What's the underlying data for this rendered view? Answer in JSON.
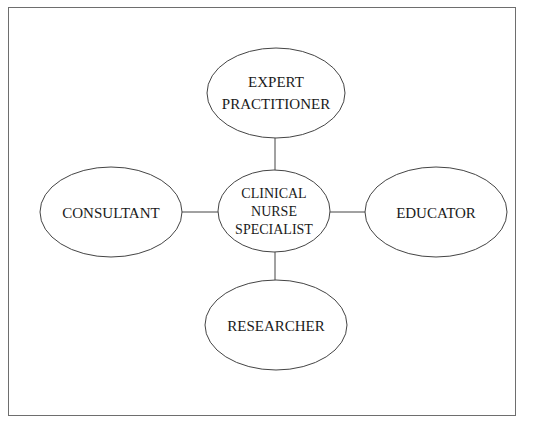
{
  "diagram": {
    "type": "hub-and-spoke",
    "center": {
      "id": "center",
      "lines": [
        "CLINICAL",
        "NURSE",
        "SPECIALIST"
      ]
    },
    "nodes": [
      {
        "id": "top",
        "position": "top",
        "lines": [
          "EXPERT",
          "PRACTITIONER"
        ]
      },
      {
        "id": "left",
        "position": "left",
        "lines": [
          "CONSULTANT"
        ]
      },
      {
        "id": "right",
        "position": "right",
        "lines": [
          "EDUCATOR"
        ]
      },
      {
        "id": "bottom",
        "position": "bottom",
        "lines": [
          "RESEARCHER"
        ]
      }
    ],
    "edges": [
      {
        "from": "center",
        "to": "top"
      },
      {
        "from": "center",
        "to": "left"
      },
      {
        "from": "center",
        "to": "right"
      },
      {
        "from": "center",
        "to": "bottom"
      }
    ],
    "colors": {
      "stroke": "#444444",
      "text": "#1a1a1a",
      "frame": "#6e6e6e",
      "background": "#ffffff"
    }
  }
}
